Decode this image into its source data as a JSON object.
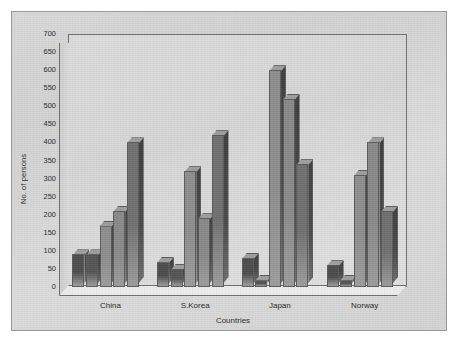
{
  "chart_data": {
    "type": "bar",
    "title": "",
    "subtitle": "",
    "xlabel": "Countries",
    "ylabel": "No. of persons",
    "categories": [
      "China",
      "S.Korea",
      "Japan",
      "Norway"
    ],
    "ylim": [
      0,
      700
    ],
    "yticks": [
      0,
      50,
      100,
      150,
      200,
      250,
      300,
      350,
      400,
      450,
      500,
      550,
      600,
      650,
      700
    ],
    "ytick_labels": [
      "0",
      "50",
      "100",
      "150",
      "200",
      "250",
      "300",
      "350",
      "400",
      "450",
      "500",
      "550",
      "600",
      "650",
      "700"
    ],
    "grid": false,
    "legend": "none",
    "style": "3d-grouped-bar-grayscale",
    "series": [
      {
        "name": "Series 1",
        "color": "#4d4d4d",
        "values": [
          90,
          70,
          80,
          60
        ]
      },
      {
        "name": "Series 2",
        "color": "#555555",
        "values": [
          90,
          50,
          20,
          20
        ]
      },
      {
        "name": "Series 3",
        "color": "#8f8f8f",
        "values": [
          170,
          320,
          600,
          310
        ]
      },
      {
        "name": "Series 4",
        "color": "#8a8a8a",
        "values": [
          210,
          190,
          520,
          400
        ]
      },
      {
        "name": "Series 5",
        "color": "#707070",
        "values": [
          400,
          420,
          340,
          210
        ]
      }
    ]
  },
  "axis": {
    "y_title": "No. of persons",
    "x_title": "Countries"
  }
}
